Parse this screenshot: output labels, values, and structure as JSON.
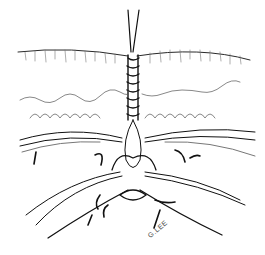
{
  "illustration": {
    "subject": "surgical suture illustration",
    "signature": "G.LEE",
    "colors": {
      "ink": "#111111",
      "paper": "#ffffff",
      "hatch": "#666666"
    }
  }
}
